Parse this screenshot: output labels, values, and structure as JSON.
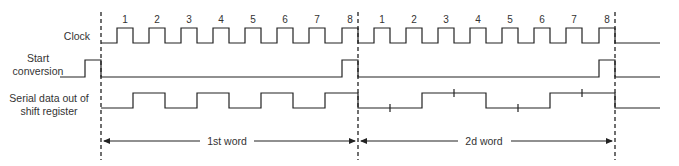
{
  "signals": {
    "clock": {
      "label": "Clock"
    },
    "start_conversion": {
      "label_line1": "Start",
      "label_line2": "conversion"
    },
    "serial_data": {
      "label_line1": "Serial data out of",
      "label_line2": "shift register"
    }
  },
  "clock_numbers": {
    "word1": [
      "1",
      "2",
      "3",
      "4",
      "5",
      "6",
      "7",
      "8"
    ],
    "word2": [
      "1",
      "2",
      "3",
      "4",
      "5",
      "6",
      "7",
      "8"
    ]
  },
  "word_spans": {
    "first": {
      "label": "1st word"
    },
    "second": {
      "label": "2d word"
    }
  },
  "colors": {
    "line": "#222222",
    "text": "#333333",
    "background": "#ffffff"
  }
}
